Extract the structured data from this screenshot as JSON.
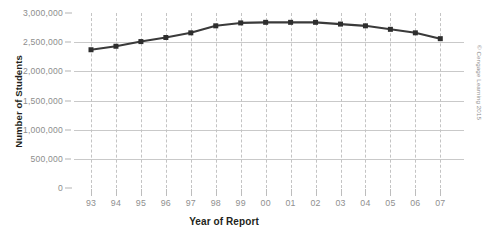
{
  "chart_data": {
    "type": "line",
    "title": "",
    "xlabel": "Year of Report",
    "ylabel": "Number of Students",
    "categories": [
      "93",
      "94",
      "95",
      "96",
      "97",
      "98",
      "99",
      "00",
      "01",
      "02",
      "03",
      "04",
      "05",
      "06",
      "07"
    ],
    "values": [
      2370000,
      2430000,
      2510000,
      2580000,
      2660000,
      2780000,
      2830000,
      2840000,
      2840000,
      2840000,
      2810000,
      2780000,
      2720000,
      2660000,
      2560000
    ],
    "series": [
      {
        "name": "Number of Students",
        "values": [
          2370000,
          2430000,
          2510000,
          2580000,
          2660000,
          2780000,
          2830000,
          2840000,
          2840000,
          2840000,
          2810000,
          2780000,
          2720000,
          2660000,
          2560000
        ]
      }
    ],
    "ylim": [
      0,
      3000000
    ],
    "ytick_values": [
      0,
      500000,
      1000000,
      1500000,
      2000000,
      2500000,
      3000000
    ],
    "ytick_labels": [
      "0",
      "500,000",
      "1,000,000",
      "1,500,000",
      "2,000,000",
      "2,500,000",
      "3,000,000"
    ],
    "grid": {
      "horizontal": true,
      "vertical": true,
      "vertical_style": "dashed"
    },
    "legend": {
      "visible": false,
      "position": "none"
    },
    "marker": "square",
    "line_color": "#3a3a3a",
    "marker_color": "#2e2e2e",
    "gridline_color": "#c9c9c9",
    "tick_label_color": "#8f8f8f",
    "axis_title_color": "#231f20"
  },
  "credit": {
    "text": "© Cengage Learning 2015"
  }
}
